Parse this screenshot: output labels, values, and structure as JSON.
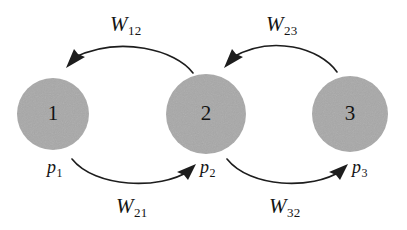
{
  "figure": {
    "kind": "state-transition-diagram",
    "background_color": "#ffffff",
    "node_fill_color": "#a8a8a8",
    "edge_color": "#1d1d1d",
    "text_color": "#141414"
  },
  "nodes": [
    {
      "id": "1",
      "number": "1",
      "probability_base": "p",
      "probability_sub": "1",
      "cx": 53,
      "cy": 114,
      "r": 36
    },
    {
      "id": "2",
      "number": "2",
      "probability_base": "p",
      "probability_sub": "2",
      "cx": 206,
      "cy": 114,
      "r": 40
    },
    {
      "id": "3",
      "number": "3",
      "probability_base": "p",
      "probability_sub": "3",
      "cx": 350,
      "cy": 114,
      "r": 38
    }
  ],
  "edges": [
    {
      "id": "w12",
      "base": "W",
      "sub": "12",
      "from": "2",
      "to": "1",
      "position": "top-left"
    },
    {
      "id": "w23",
      "base": "W",
      "sub": "23",
      "from": "3",
      "to": "2",
      "position": "top-right"
    },
    {
      "id": "w21",
      "base": "W",
      "sub": "21",
      "from": "1",
      "to": "2",
      "position": "bottom-left"
    },
    {
      "id": "w32",
      "base": "W",
      "sub": "32",
      "from": "2",
      "to": "3",
      "position": "bottom-right"
    }
  ],
  "labels": {
    "w12": {
      "base": "W",
      "sub": "12"
    },
    "w23": {
      "base": "W",
      "sub": "23"
    },
    "w21": {
      "base": "W",
      "sub": "21"
    },
    "w32": {
      "base": "W",
      "sub": "32"
    },
    "p1": {
      "base": "p",
      "sub": "1"
    },
    "p2": {
      "base": "p",
      "sub": "2"
    },
    "p3": {
      "base": "p",
      "sub": "3"
    },
    "n1": "1",
    "n2": "2",
    "n3": "3"
  }
}
